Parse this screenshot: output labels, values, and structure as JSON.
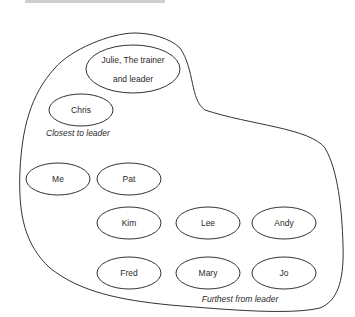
{
  "diagram": {
    "outline_color": "#333333",
    "people": [
      {
        "id": "julie",
        "lines": [
          "Julie, The trainer",
          "and leader"
        ],
        "cx": 133,
        "cy": 69,
        "rx": 47,
        "ry": 24
      },
      {
        "id": "chris",
        "lines": [
          "Chris"
        ],
        "cx": 81,
        "cy": 110,
        "rx": 32,
        "ry": 16
      },
      {
        "id": "me",
        "lines": [
          "Me"
        ],
        "cx": 58,
        "cy": 179,
        "rx": 32,
        "ry": 16
      },
      {
        "id": "pat",
        "lines": [
          "Pat"
        ],
        "cx": 129,
        "cy": 179,
        "rx": 32,
        "ry": 16
      },
      {
        "id": "kim",
        "lines": [
          "Kim"
        ],
        "cx": 129,
        "cy": 223,
        "rx": 32,
        "ry": 16
      },
      {
        "id": "lee",
        "lines": [
          "Lee"
        ],
        "cx": 208,
        "cy": 223,
        "rx": 32,
        "ry": 16
      },
      {
        "id": "andy",
        "lines": [
          "Andy"
        ],
        "cx": 284,
        "cy": 223,
        "rx": 32,
        "ry": 16
      },
      {
        "id": "fred",
        "lines": [
          "Fred"
        ],
        "cx": 129,
        "cy": 273,
        "rx": 32,
        "ry": 16
      },
      {
        "id": "mary",
        "lines": [
          "Mary"
        ],
        "cx": 208,
        "cy": 273,
        "rx": 32,
        "ry": 16
      },
      {
        "id": "jo",
        "lines": [
          "Jo"
        ],
        "cx": 284,
        "cy": 273,
        "rx": 32,
        "ry": 16
      }
    ],
    "captions": {
      "closest": "Closest to leader",
      "furthest": "Furthest from leader"
    }
  }
}
